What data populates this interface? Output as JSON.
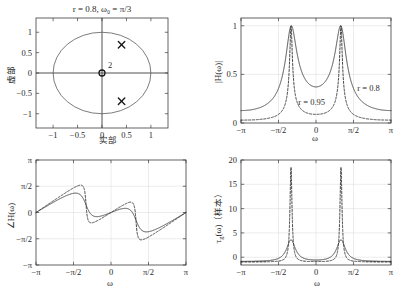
{
  "figure": {
    "caption_title": "r = 0.8, ω₀ = π/3"
  },
  "chart_data": [
    {
      "id": "pole-zero",
      "type": "scatter",
      "title": "r = 0.8, ω₀ = π/3",
      "xlabel": "实部",
      "ylabel": "虚部",
      "xlim": [
        -1.35,
        1.35
      ],
      "ylim": [
        -1.35,
        1.35
      ],
      "xticks": [
        -1,
        -0.5,
        0,
        0.5,
        1
      ],
      "xticklabels": [
        "−1",
        "−0.5",
        "0",
        "0.5",
        "1"
      ],
      "yticks": [
        -1,
        -0.5,
        0,
        0.5,
        1
      ],
      "yticklabels": [
        "−1",
        "−0.5",
        "0",
        "0.5",
        "1"
      ],
      "grid": false,
      "unit_circle": {
        "radius": 1.0
      },
      "poles": [
        {
          "re": 0.4,
          "im": 0.6928,
          "marker": "x"
        },
        {
          "re": 0.4,
          "im": -0.6928,
          "marker": "x"
        }
      ],
      "zeros": [
        {
          "re": 0.0,
          "im": 0.0,
          "marker": "o",
          "multiplicity": 2,
          "multiplicity_label": "2"
        }
      ]
    },
    {
      "id": "magnitude-response",
      "type": "line",
      "xlabel": "ω",
      "ylabel": "|H(ω)|",
      "xlim": [
        -3.14159,
        3.14159
      ],
      "ylim": [
        0,
        1.08
      ],
      "xticks": [
        -3.14159,
        -1.5708,
        0,
        1.5708,
        3.14159
      ],
      "xticklabels": [
        "−π",
        "−π/2",
        "0",
        "π/2",
        "π"
      ],
      "yticks": [
        0,
        0.5,
        1
      ],
      "yticklabels": [
        "0",
        "0.5",
        "1"
      ],
      "grid": true,
      "series": [
        {
          "name": "r = 0.8",
          "r": 0.8,
          "w0": 1.0472,
          "style": "solid",
          "peak": 1.0,
          "min_at_zero": 0.375,
          "edge_value": 0.125
        },
        {
          "name": "r = 0.95",
          "r": 0.95,
          "w0": 1.0472,
          "style": "dashed",
          "peak": 1.0,
          "min_at_zero": 0.092,
          "edge_value": 0.031
        }
      ],
      "annotations": [
        {
          "text": "r = 0.8",
          "x": 2.2,
          "y": 0.33
        },
        {
          "text": "r = 0.95",
          "x": -0.18,
          "y": 0.185
        }
      ]
    },
    {
      "id": "phase-response",
      "type": "line",
      "xlabel": "ω",
      "ylabel": "∠H(ω)",
      "xlim": [
        -3.14159,
        3.14159
      ],
      "ylim": [
        -3.14159,
        3.14159
      ],
      "xticks": [
        -3.14159,
        -1.5708,
        0,
        1.5708,
        3.14159
      ],
      "xticklabels": [
        "−π",
        "−π/2",
        "0",
        "π/2",
        "π"
      ],
      "yticks": [
        -3.14159,
        -1.5708,
        0,
        1.5708,
        3.14159
      ],
      "yticklabels": [
        "−π",
        "−π/2",
        "0",
        "π/2",
        "π"
      ],
      "grid": true,
      "series": [
        {
          "name": "r = 0.8",
          "r": 0.8,
          "w0": 1.0472,
          "style": "solid"
        },
        {
          "name": "r = 0.95",
          "r": 0.95,
          "w0": 1.0472,
          "style": "dashed"
        }
      ]
    },
    {
      "id": "group-delay",
      "type": "line",
      "xlabel": "ω",
      "ylabel": "τg(ω)（样本）",
      "ylabel_parts": {
        "symbol": "τ",
        "sub": "g",
        "arg": "(ω)",
        "unit": "（样本）"
      },
      "xlim": [
        -3.14159,
        3.14159
      ],
      "ylim": [
        -1.6,
        20
      ],
      "xticks": [
        -3.14159,
        -1.5708,
        0,
        1.5708,
        3.14159
      ],
      "xticklabels": [
        "−π",
        "−π/2",
        "0",
        "π/2",
        "π"
      ],
      "yticks": [
        0,
        5,
        10,
        15,
        20
      ],
      "yticklabels": [
        "0",
        "5",
        "10",
        "15",
        "20"
      ],
      "grid": true,
      "series": [
        {
          "name": "r = 0.8",
          "r": 0.8,
          "w0": 1.0472,
          "style": "solid",
          "peak": 3.6
        },
        {
          "name": "r = 0.95",
          "r": 0.95,
          "w0": 1.0472,
          "style": "dashed",
          "peak": 18.4
        }
      ]
    }
  ]
}
